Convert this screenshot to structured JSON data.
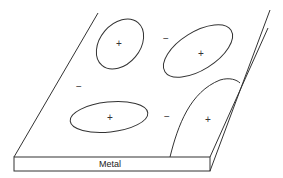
{
  "diagram": {
    "type": "schematic",
    "slab_label": "Metal",
    "colors": {
      "line": "#333333",
      "background": "#ffffff"
    },
    "regions": [
      {
        "id": "region-top-left",
        "shape": "ellipse",
        "sign": "+"
      },
      {
        "id": "region-top-right",
        "shape": "ellipse",
        "sign": "+"
      },
      {
        "id": "region-bottom-left",
        "shape": "ellipse",
        "sign": "+"
      },
      {
        "id": "region-right-edge",
        "shape": "arch",
        "sign": "+"
      }
    ],
    "surface_signs": [
      {
        "id": "minus-top-middle",
        "sign": "−"
      },
      {
        "id": "minus-left",
        "sign": "−"
      },
      {
        "id": "minus-bottom-middle",
        "sign": "−"
      }
    ]
  }
}
